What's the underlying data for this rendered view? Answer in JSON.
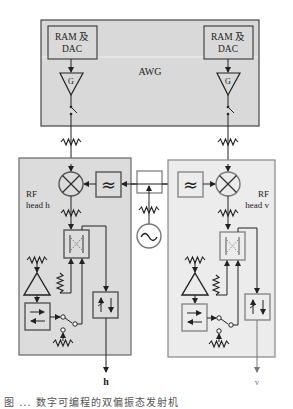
{
  "diagram": {
    "awg": {
      "label": "AWG",
      "fill": "#d9d9d9",
      "channels": [
        {
          "ram_line1": "RAM 及",
          "ram_line2": "DAC",
          "gain_label": "G"
        },
        {
          "ram_line1": "RAM 及",
          "ram_line2": "DAC",
          "gain_label": "G"
        }
      ]
    },
    "rf_heads": [
      {
        "line1": "RF",
        "line2": "head h",
        "fill": "#dcdcdc",
        "output_label": "h"
      },
      {
        "line1": "RF",
        "line2": "head v",
        "fill": "#ececec",
        "output_label": "v"
      }
    ],
    "components": {
      "mixer": "mixer-symbol",
      "filter": "≈",
      "oscillator": "~",
      "splitter": "power-splitter",
      "attenuator": "attenuator-zigzag",
      "coupler": "directional-coupler",
      "amplifier": "amplifier-triangle",
      "switch_box": "transfer-switch",
      "isolator": "isolator"
    },
    "caption": "图 ... 数字可编程的双偏振态发射机"
  }
}
